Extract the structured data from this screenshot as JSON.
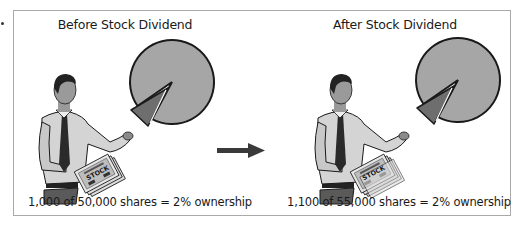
{
  "panels": [
    {
      "title": "Before Stock Dividend",
      "caption": "1,000 of 50,000 shares = 2% ownership",
      "certificate_label": "STOCK",
      "owned_shares": 1000,
      "total_shares": 50000,
      "ownership_percent": 2
    },
    {
      "title": "After Stock Dividend",
      "caption": "1,100 of 55,000 shares = 2% ownership",
      "certificate_label": "STOCK",
      "owned_shares": 1100,
      "total_shares": 55000,
      "ownership_percent": 2
    }
  ],
  "transition_icon": "right-arrow-icon",
  "colors": {
    "pie_fill": "#a6a6a6",
    "slice_fill": "#6e6e6e",
    "outline": "#1a1a1a",
    "arrow": "#3a3a3a",
    "frame_border": "#a9a9a9"
  }
}
